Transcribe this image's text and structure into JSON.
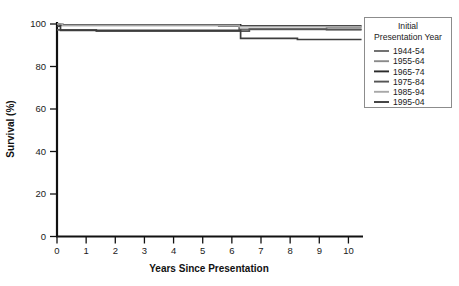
{
  "chart_data": {
    "type": "line",
    "title": "",
    "xlabel": "Years Since Presentation",
    "ylabel": "Survival (%)",
    "xlim": [
      0,
      10.5
    ],
    "ylim": [
      0,
      100
    ],
    "xticks": [
      "0",
      "1",
      "2",
      "3",
      "4",
      "5",
      "6",
      "7",
      "8",
      "9",
      "10"
    ],
    "yticks": [
      "0",
      "20",
      "40",
      "60",
      "80",
      "100"
    ],
    "grid": false,
    "legend_position": "right",
    "legend_title": "Initial\nPresentation Year",
    "legend_title_line1": "Initial",
    "legend_title_line2": "Presentation Year",
    "step_plot": true,
    "series": [
      {
        "name": "1944-54",
        "color": "#6b6b6b",
        "x": [
          0,
          0.15,
          6.2,
          6.25,
          10.45
        ],
        "values": [
          100,
          99.3,
          99.3,
          97.5,
          97.5
        ]
      },
      {
        "name": "1955-64",
        "color": "#8a8a8a",
        "x": [
          0,
          0.2,
          5.5,
          5.55,
          9.2,
          9.25,
          10.45
        ],
        "values": [
          100,
          99.5,
          99.5,
          99.0,
          99.0,
          98.3,
          98.3
        ]
      },
      {
        "name": "1965-74",
        "color": "#2b2b2b",
        "x": [
          0,
          0.1,
          6.25,
          6.3,
          10.45
        ],
        "values": [
          100,
          99.6,
          99.6,
          99.1,
          99.1
        ]
      },
      {
        "name": "1975-84",
        "color": "#555555",
        "x": [
          0,
          1.3,
          1.35,
          6.55,
          6.6,
          9.2,
          9.25,
          10.45
        ],
        "values": [
          97.2,
          97.2,
          96.6,
          96.6,
          97.6,
          97.6,
          97.3,
          97.3
        ]
      },
      {
        "name": "1985-94",
        "color": "#a8a8a8",
        "x": [
          0,
          0.18,
          6.2,
          6.25,
          10.45
        ],
        "values": [
          100,
          99.4,
          99.4,
          98.8,
          98.8
        ]
      },
      {
        "name": "1995-04",
        "color": "#3d3d3d",
        "x": [
          0,
          0.12,
          6.2,
          6.3,
          8.15,
          8.25,
          10.45
        ],
        "values": [
          99.0,
          97.0,
          97.0,
          93.2,
          93.2,
          92.7,
          92.7
        ]
      }
    ]
  },
  "axes": {
    "x_label": "Years Since Presentation",
    "y_label": "Survival (%)"
  },
  "legend": {
    "title_line1": "Initial",
    "title_line2": "Presentation Year",
    "items": [
      {
        "label": "1944-54",
        "color": "#6b6b6b"
      },
      {
        "label": "1955-64",
        "color": "#8a8a8a"
      },
      {
        "label": "1965-74",
        "color": "#2b2b2b"
      },
      {
        "label": "1975-84",
        "color": "#555555"
      },
      {
        "label": "1985-94",
        "color": "#a8a8a8"
      },
      {
        "label": "1995-04",
        "color": "#3d3d3d"
      }
    ]
  },
  "colors": {
    "axis": "#111111",
    "text": "#1a1a1a",
    "legend_border": "#8c8c8c",
    "background": "#ffffff"
  }
}
